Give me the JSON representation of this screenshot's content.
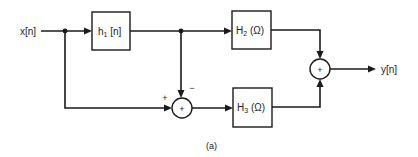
{
  "diagram": {
    "caption": "(a)",
    "input": {
      "label": "x[n]"
    },
    "output": {
      "label": "y[n]"
    },
    "blocks": {
      "h1": {
        "label_main": "h",
        "label_sub": "1",
        "label_arg": " [n]"
      },
      "H2": {
        "label_main": "H",
        "label_sub": "2",
        "label_arg": " (Ω)"
      },
      "H3": {
        "label_main": "H",
        "label_sub": "3",
        "label_arg": " (Ω)"
      }
    },
    "summers": {
      "middle": {
        "symbol": "+",
        "input_signs": {
          "left": "+",
          "top": "−"
        }
      },
      "output": {
        "symbol": "+"
      }
    },
    "colors": {
      "line": "#1a1a1a",
      "text": "#222222",
      "background": "#ffffff"
    }
  }
}
